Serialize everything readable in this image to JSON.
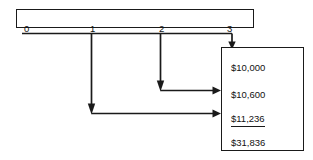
{
  "diagram": {
    "timeline": {
      "name": "period-timeline",
      "ticks": [
        {
          "label": "0",
          "x": 22
        },
        {
          "label": "1",
          "x": 88
        },
        {
          "label": "2",
          "x": 157
        },
        {
          "label": "3",
          "x": 226
        }
      ]
    },
    "values_box": {
      "name": "future-values-box",
      "rows": [
        {
          "amount": "$10,000",
          "y": 14,
          "ruled": false
        },
        {
          "amount": "$10,600",
          "y": 41,
          "ruled": false
        },
        {
          "amount": "$11,236",
          "y": 65,
          "ruled": true
        },
        {
          "amount": "$31,836",
          "y": 89,
          "ruled": false
        }
      ]
    },
    "colors": {
      "line": "#1a1a1a",
      "text": "#111111",
      "background": "#ffffff"
    }
  }
}
